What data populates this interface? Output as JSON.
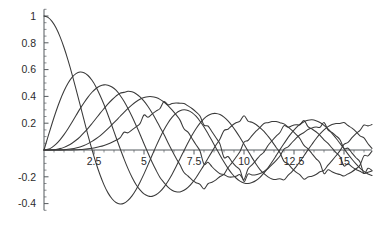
{
  "chart_data": {
    "type": "line",
    "title": "",
    "subtitle": "",
    "xlabel": "",
    "ylabel": "",
    "xlim": [
      0,
      16.4
    ],
    "ylim": [
      -0.45,
      1.05
    ],
    "grid": false,
    "legend": "none",
    "x_ticks": [
      {
        "value": 2.5,
        "label": "2.5"
      },
      {
        "value": 5,
        "label": "5"
      },
      {
        "value": 7.5,
        "label": "7.5"
      },
      {
        "value": 10,
        "label": "10"
      },
      {
        "value": 12.5,
        "label": "12.5"
      },
      {
        "value": 15,
        "label": "15"
      }
    ],
    "x_minor_step": 0.5,
    "y_ticks": [
      {
        "value": 1.0,
        "label": "1"
      },
      {
        "value": 0.8,
        "label": "0.8"
      },
      {
        "value": 0.6,
        "label": "0.6"
      },
      {
        "value": 0.4,
        "label": "0.4"
      },
      {
        "value": 0.2,
        "label": "0.2"
      },
      {
        "value": -0.2,
        "label": "-0.2"
      },
      {
        "value": -0.4,
        "label": "-0.4"
      }
    ],
    "y_minor_step": 0.05,
    "series": [
      {
        "name": "J0",
        "order": 0,
        "color": "#3a3a3a",
        "x": [
          0,
          0.2,
          0.4,
          0.6,
          0.8,
          1,
          1.2,
          1.4,
          1.6,
          1.8,
          2,
          2.2,
          2.4,
          2.6,
          2.8,
          3,
          3.2,
          3.4,
          3.6,
          3.8,
          4,
          4.2,
          4.4,
          4.6,
          4.8,
          5,
          5.2,
          5.4,
          5.6,
          5.8,
          6,
          6.2,
          6.4,
          6.6,
          6.8,
          7,
          7.2,
          7.4,
          7.6,
          7.8,
          8,
          8.2,
          8.4,
          8.6,
          8.8,
          9,
          9.2,
          9.4,
          9.6,
          9.8,
          10,
          10.2,
          10.4,
          10.6,
          10.8,
          11,
          11.2,
          11.4,
          11.6,
          11.8,
          12,
          12.2,
          12.4,
          12.6,
          12.8,
          13,
          13.2,
          13.4,
          13.6,
          13.8,
          14,
          14.2,
          14.4,
          14.6,
          14.8,
          15,
          15.2,
          15.4,
          15.6,
          15.8,
          16,
          16.2,
          16.4
        ],
        "y": [
          1,
          0.99,
          0.96,
          0.912,
          0.846,
          0.765,
          0.671,
          0.567,
          0.455,
          0.34,
          0.224,
          0.11,
          0.003,
          -0.097,
          -0.185,
          -0.26,
          -0.32,
          -0.364,
          -0.392,
          -0.403,
          -0.397,
          -0.376,
          -0.342,
          -0.296,
          -0.24,
          -0.178,
          -0.111,
          -0.041,
          0.027,
          0.092,
          0.151,
          0.202,
          0.243,
          0.274,
          0.293,
          0.3,
          0.295,
          0.279,
          0.252,
          0.215,
          0.172,
          0.122,
          0.069,
          0.015,
          -0.039,
          -0.09,
          -0.137,
          -0.177,
          -0.209,
          -0.232,
          -0.246,
          -0.25,
          -0.243,
          -0.228,
          -0.204,
          -0.171,
          -0.133,
          -0.09,
          -0.044,
          0.003,
          0.048,
          0.092,
          0.131,
          0.165,
          0.192,
          0.211,
          0.222,
          0.225,
          0.219,
          0.205,
          0.184,
          0.157,
          0.124,
          0.088,
          0.049,
          0.009,
          -0.031,
          -0.069,
          -0.104,
          -0.135,
          -0.16,
          -0.179,
          -0.19
        ]
      },
      {
        "name": "J1",
        "order": 1,
        "color": "#3a3a3a",
        "x": [
          0,
          0.2,
          0.4,
          0.6,
          0.8,
          1,
          1.2,
          1.4,
          1.6,
          1.8,
          2,
          2.2,
          2.4,
          2.6,
          2.8,
          3,
          3.2,
          3.4,
          3.6,
          3.8,
          4,
          4.2,
          4.4,
          4.6,
          4.8,
          5,
          5.2,
          5.4,
          5.6,
          5.8,
          6,
          6.2,
          6.4,
          6.6,
          6.8,
          7,
          7.2,
          7.4,
          7.6,
          7.8,
          8,
          8.2,
          8.4,
          8.6,
          8.8,
          9,
          9.2,
          9.4,
          9.6,
          9.8,
          10,
          10.2,
          10.4,
          10.6,
          10.8,
          11,
          11.2,
          11.4,
          11.6,
          11.8,
          12,
          12.2,
          12.4,
          12.6,
          12.8,
          13,
          13.2,
          13.4,
          13.6,
          13.8,
          14,
          14.2,
          14.4,
          14.6,
          14.8,
          15,
          15.2,
          15.4,
          15.6,
          15.8,
          16,
          16.2,
          16.4
        ],
        "y": [
          0,
          0.0995,
          0.196,
          0.287,
          0.369,
          0.44,
          0.498,
          0.542,
          0.57,
          0.582,
          0.577,
          0.556,
          0.52,
          0.471,
          0.409,
          0.339,
          0.261,
          0.179,
          0.095,
          0.013,
          -0.066,
          -0.139,
          -0.203,
          -0.257,
          -0.298,
          -0.328,
          -0.343,
          -0.346,
          -0.334,
          -0.311,
          -0.277,
          -0.233,
          -0.182,
          -0.125,
          -0.065,
          -0.005,
          0.054,
          0.11,
          0.159,
          0.201,
          0.235,
          0.258,
          0.271,
          0.273,
          0.265,
          0.245,
          0.217,
          0.181,
          0.139,
          0.093,
          0.043,
          -0.007,
          -0.057,
          -0.104,
          -0.146,
          -0.177,
          -0.201,
          -0.216,
          -0.22,
          -0.214,
          -0.223,
          -0.19,
          -0.161,
          -0.126,
          -0.086,
          -0.043,
          0.001,
          0.043,
          0.084,
          0.12,
          0.15,
          0.174,
          0.19,
          0.198,
          0.198,
          0.205,
          0.183,
          0.163,
          0.137,
          0.106,
          0.09,
          0.047,
          0.012
        ]
      },
      {
        "name": "J2",
        "order": 2,
        "color": "#3a3a3a",
        "x": [
          0,
          0.2,
          0.4,
          0.6,
          0.8,
          1,
          1.2,
          1.4,
          1.6,
          1.8,
          2,
          2.2,
          2.4,
          2.6,
          2.8,
          3,
          3.2,
          3.4,
          3.6,
          3.8,
          4,
          4.2,
          4.4,
          4.6,
          4.8,
          5,
          5.2,
          5.4,
          5.6,
          5.8,
          6,
          6.2,
          6.4,
          6.6,
          6.8,
          7,
          7.2,
          7.4,
          7.6,
          7.8,
          8,
          8.2,
          8.4,
          8.6,
          8.8,
          9,
          9.2,
          9.4,
          9.6,
          9.8,
          10,
          10.2,
          10.4,
          10.6,
          10.8,
          11,
          11.2,
          11.4,
          11.6,
          11.8,
          12,
          12.2,
          12.4,
          12.6,
          12.8,
          13,
          13.2,
          13.4,
          13.6,
          13.8,
          14,
          14.2,
          14.4,
          14.6,
          14.8,
          15,
          15.2,
          15.4,
          15.6,
          15.8,
          16,
          16.2,
          16.4
        ],
        "y": [
          0,
          0.005,
          0.02,
          0.044,
          0.076,
          0.115,
          0.159,
          0.207,
          0.257,
          0.307,
          0.353,
          0.395,
          0.431,
          0.459,
          0.478,
          0.486,
          0.484,
          0.47,
          0.446,
          0.409,
          0.364,
          0.31,
          0.25,
          0.185,
          0.118,
          0.047,
          -0.022,
          -0.089,
          -0.15,
          -0.205,
          -0.243,
          -0.277,
          -0.3,
          -0.312,
          -0.313,
          -0.301,
          -0.279,
          -0.247,
          -0.207,
          -0.16,
          -0.113,
          -0.062,
          -0.012,
          0.037,
          0.082,
          0.145,
          0.155,
          0.183,
          0.203,
          0.216,
          0.255,
          0.216,
          0.207,
          0.19,
          0.166,
          0.139,
          0.103,
          0.064,
          0.021,
          -0.021,
          -0.085,
          -0.102,
          -0.137,
          -0.165,
          -0.186,
          -0.218,
          -0.201,
          -0.196,
          -0.183,
          -0.163,
          -0.152,
          -0.113,
          -0.079,
          -0.043,
          -0.005,
          0.042,
          0.057,
          0.092,
          0.123,
          0.147,
          0.186,
          0.18,
          0.19
        ]
      },
      {
        "name": "J3",
        "order": 3,
        "color": "#3a3a3a",
        "x": [
          0,
          0.2,
          0.4,
          0.6,
          0.8,
          1,
          1.2,
          1.4,
          1.6,
          1.8,
          2,
          2.2,
          2.4,
          2.6,
          2.8,
          3,
          3.2,
          3.4,
          3.6,
          3.8,
          4,
          4.2,
          4.4,
          4.6,
          4.8,
          5,
          5.2,
          5.4,
          5.6,
          5.8,
          6,
          6.2,
          6.4,
          6.6,
          6.8,
          7,
          7.2,
          7.4,
          7.6,
          7.8,
          8,
          8.2,
          8.4,
          8.6,
          8.8,
          9,
          9.2,
          9.4,
          9.6,
          9.8,
          10,
          10.2,
          10.4,
          10.6,
          10.8,
          11,
          11.2,
          11.4,
          11.6,
          11.8,
          12,
          12.2,
          12.4,
          12.6,
          12.8,
          13,
          13.2,
          13.4,
          13.6,
          13.8,
          14,
          14.2,
          14.4,
          14.6,
          14.8,
          15,
          15.2,
          15.4,
          15.6,
          15.8,
          16,
          16.2,
          16.4
        ],
        "y": [
          0,
          0.0002,
          0.0013,
          0.0044,
          0.0102,
          0.0196,
          0.0329,
          0.0505,
          0.0725,
          0.0988,
          0.129,
          0.162,
          0.198,
          0.235,
          0.273,
          0.309,
          0.344,
          0.375,
          0.402,
          0.424,
          0.43,
          0.438,
          0.434,
          0.42,
          0.397,
          0.365,
          0.325,
          0.278,
          0.226,
          0.17,
          0.115,
          0.054,
          -0.004,
          -0.06,
          -0.111,
          -0.168,
          -0.194,
          -0.223,
          -0.244,
          -0.257,
          -0.291,
          -0.252,
          -0.241,
          -0.223,
          -0.198,
          -0.181,
          -0.133,
          -0.095,
          -0.054,
          -0.012,
          0.058,
          0.071,
          0.107,
          0.14,
          0.168,
          0.198,
          0.204,
          0.212,
          0.212,
          0.204,
          0.195,
          0.172,
          0.147,
          0.117,
          0.084,
          0.034,
          0.009,
          -0.028,
          -0.064,
          -0.097,
          -0.176,
          -0.147,
          -0.162,
          -0.176,
          -0.183,
          -0.194,
          -0.178,
          -0.162,
          -0.14,
          -0.113,
          -0.043,
          -0.044,
          -0.008
        ]
      },
      {
        "name": "J4",
        "order": 4,
        "color": "#3a3a3a",
        "x": [
          0,
          0.2,
          0.4,
          0.6,
          0.8,
          1,
          1.2,
          1.4,
          1.6,
          1.8,
          2,
          2.2,
          2.4,
          2.6,
          2.8,
          3,
          3.2,
          3.4,
          3.6,
          3.8,
          4,
          4.2,
          4.4,
          4.6,
          4.8,
          5,
          5.2,
          5.4,
          5.6,
          5.8,
          6,
          6.2,
          6.4,
          6.6,
          6.8,
          7,
          7.2,
          7.4,
          7.6,
          7.8,
          8,
          8.2,
          8.4,
          8.6,
          8.8,
          9,
          9.2,
          9.4,
          9.6,
          9.8,
          10,
          10.2,
          10.4,
          10.6,
          10.8,
          11,
          11.2,
          11.4,
          11.6,
          11.8,
          12,
          12.2,
          12.4,
          12.6,
          12.8,
          13,
          13.2,
          13.4,
          13.6,
          13.8,
          14,
          14.2,
          14.4,
          14.6,
          14.8,
          15,
          15.2,
          15.4,
          15.6,
          15.8,
          16,
          16.2,
          16.4
        ],
        "y": [
          0,
          0,
          0.0001,
          0.0003,
          0.001,
          0.0025,
          0.005,
          0.0091,
          0.015,
          0.0232,
          0.034,
          0.0476,
          0.064,
          0.084,
          0.106,
          0.132,
          0.16,
          0.189,
          0.22,
          0.25,
          0.281,
          0.31,
          0.337,
          0.36,
          0.379,
          0.391,
          0.398,
          0.398,
          0.391,
          0.378,
          0.358,
          0.332,
          0.3,
          0.264,
          0.223,
          0.158,
          0.133,
          0.086,
          0.039,
          -0.008,
          -0.105,
          -0.091,
          -0.125,
          -0.154,
          -0.178,
          -0.182,
          -0.2,
          -0.202,
          -0.196,
          -0.184,
          -0.22,
          -0.141,
          -0.111,
          -0.077,
          -0.041,
          -0.015,
          0.034,
          0.069,
          0.102,
          0.131,
          0.182,
          0.169,
          0.181,
          0.188,
          0.189,
          0.22,
          0.174,
          0.157,
          0.136,
          0.11,
          0.076,
          0.049,
          0.015,
          -0.019,
          -0.051,
          -0.119,
          -0.103,
          -0.126,
          -0.145,
          -0.159,
          -0.175,
          -0.166,
          -0.156
        ]
      },
      {
        "name": "J5",
        "order": 5,
        "color": "#3a3a3a",
        "x": [
          0,
          0.2,
          0.4,
          0.6,
          0.8,
          1,
          1.2,
          1.4,
          1.6,
          1.8,
          2,
          2.2,
          2.4,
          2.6,
          2.8,
          3,
          3.2,
          3.4,
          3.6,
          3.8,
          4,
          4.2,
          4.4,
          4.6,
          4.8,
          5,
          5.2,
          5.4,
          5.6,
          5.8,
          6,
          6.2,
          6.4,
          6.6,
          6.8,
          7,
          7.2,
          7.4,
          7.6,
          7.8,
          8,
          8.2,
          8.4,
          8.6,
          8.8,
          9,
          9.2,
          9.4,
          9.6,
          9.8,
          10,
          10.2,
          10.4,
          10.6,
          10.8,
          11,
          11.2,
          11.4,
          11.6,
          11.8,
          12,
          12.2,
          12.4,
          12.6,
          12.8,
          13,
          13.2,
          13.4,
          13.6,
          13.8,
          14,
          14.2,
          14.4,
          14.6,
          14.8,
          15,
          15.2,
          15.4,
          15.6,
          15.8,
          16,
          16.2,
          16.4
        ],
        "y": [
          0,
          0,
          0,
          0,
          0.0001,
          0.0002,
          0.0005,
          0.001,
          0.0019,
          0.0033,
          0.0055,
          0.0085,
          0.0127,
          0.0183,
          0.0254,
          0.0343,
          0.045,
          0.058,
          0.073,
          0.09,
          0.132,
          0.128,
          0.15,
          0.173,
          0.197,
          0.261,
          0.244,
          0.268,
          0.29,
          0.31,
          0.362,
          0.337,
          0.347,
          0.351,
          0.349,
          0.347,
          0.329,
          0.31,
          0.284,
          0.253,
          0.186,
          0.179,
          0.136,
          0.091,
          0.044,
          -0.055,
          -0.049,
          -0.089,
          -0.123,
          -0.15,
          -0.234,
          -0.18,
          -0.186,
          -0.185,
          -0.176,
          -0.16,
          -0.138,
          -0.11,
          -0.079,
          -0.045,
          0.007,
          0.024,
          0.056,
          0.087,
          0.114,
          0.131,
          0.153,
          0.165,
          0.171,
          0.17,
          0.205,
          0.15,
          0.131,
          0.106,
          0.077,
          0.013,
          0.013,
          -0.023,
          -0.058,
          -0.09,
          -0.175,
          -0.137,
          -0.152
        ]
      }
    ]
  },
  "axes": {
    "origin_px": {
      "x": 44,
      "y": 150
    },
    "x_scale_px_per_unit": 20,
    "y_scale_px_per_unit": 134,
    "axis_color": "#555a5e",
    "curve_color": "#3a3a3a"
  }
}
